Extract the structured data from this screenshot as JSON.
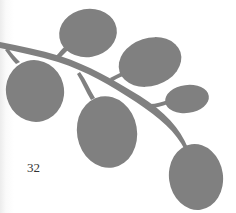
{
  "page": {
    "number": "32",
    "illustration": "leafy-branch",
    "colors": {
      "leaf": "#808080",
      "background": "#ffffff",
      "text": "#333333"
    }
  }
}
